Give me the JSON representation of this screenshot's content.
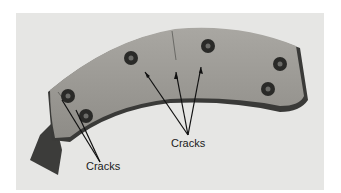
{
  "figure": {
    "labels": [
      {
        "text": "Cracks",
        "position": "left"
      },
      {
        "text": "Cracks",
        "position": "center"
      }
    ]
  }
}
